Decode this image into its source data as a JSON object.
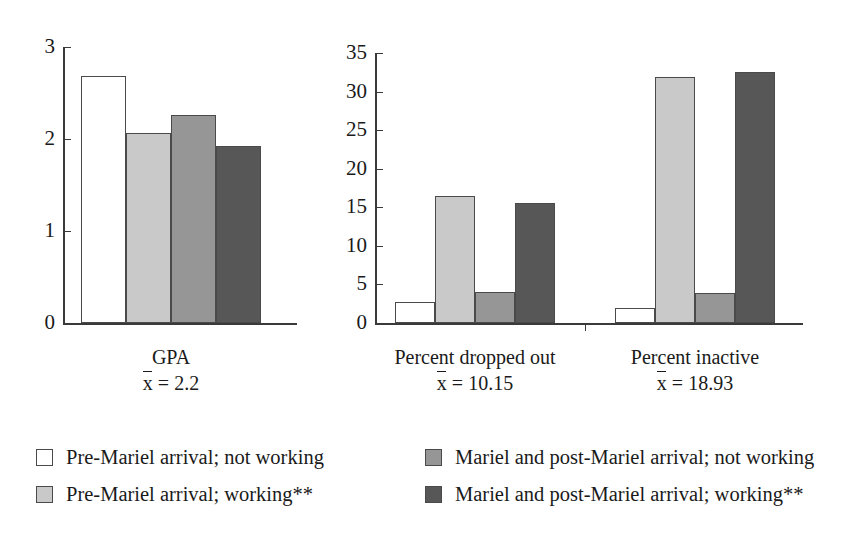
{
  "chart_data": {
    "type": "bar",
    "title": "",
    "subtitle": "",
    "xlabel": "",
    "ylabel": "",
    "grid": false,
    "legend_position": "bottom",
    "panels": [
      {
        "name": "GPA",
        "category": "GPA",
        "mean_prefix": "x",
        "mean_text": "= 2.2",
        "mean_value": "2.2",
        "ylim": [
          0,
          3
        ],
        "yticks": [
          "0",
          "1",
          "2",
          "3"
        ],
        "ytick_values": [
          0,
          1,
          2,
          3
        ],
        "values": [
          2.68,
          2.06,
          2.26,
          1.92
        ]
      },
      {
        "name": "Percent",
        "ylim": [
          0,
          35
        ],
        "yticks": [
          "0",
          "5",
          "10",
          "15",
          "20",
          "25",
          "30",
          "35"
        ],
        "ytick_values": [
          0,
          5,
          10,
          15,
          20,
          25,
          30,
          35
        ],
        "groups": [
          {
            "category": "Percent dropped out",
            "mean_prefix": "x",
            "mean_text": "= 10.15",
            "mean_value": "10.15",
            "values": [
              2.7,
              16.4,
              4.0,
              15.5
            ]
          },
          {
            "category": "Percent inactive",
            "mean_prefix": "x",
            "mean_text": "= 18.93",
            "mean_value": "18.93",
            "values": [
              1.9,
              31.9,
              3.9,
              32.5
            ]
          }
        ]
      }
    ],
    "series": [
      {
        "name": "Pre-Mariel arrival; not working",
        "color": "#ffffff"
      },
      {
        "name": "Pre-Mariel arrival; working**",
        "color": "#c9c9c9"
      },
      {
        "name": "Mariel and post-Mariel arrival; not working",
        "color": "#969696"
      },
      {
        "name": "Mariel and post-Mariel arrival; working**",
        "color": "#575757"
      }
    ]
  },
  "legend": {
    "items": [
      {
        "label": "Pre-Mariel arrival; not working",
        "color": "#ffffff"
      },
      {
        "label": "Pre-Mariel arrival; working**",
        "color": "#c9c9c9"
      },
      {
        "label": "Mariel and post-Mariel arrival; not working",
        "color": "#969696"
      },
      {
        "label": "Mariel and post-Mariel arrival; working**",
        "color": "#575757"
      }
    ]
  },
  "colors": {
    "axis": "#3a3a3a",
    "bar_outline": "#4a4a4a",
    "text": "#1a1a1a",
    "background": "#ffffff"
  }
}
